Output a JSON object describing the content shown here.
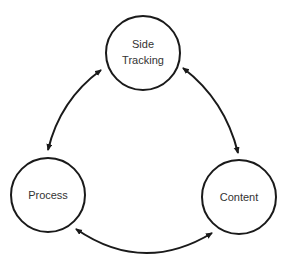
{
  "diagram": {
    "nodes": [
      {
        "id": "side-tracking",
        "line1": "Side",
        "line2": "Tracking"
      },
      {
        "id": "process",
        "label": "Process"
      },
      {
        "id": "content",
        "label": "Content"
      }
    ],
    "edges": [
      {
        "from": "side-tracking",
        "to": "process",
        "bidirectional": true
      },
      {
        "from": "side-tracking",
        "to": "content",
        "bidirectional": true
      },
      {
        "from": "process",
        "to": "content",
        "bidirectional": true
      }
    ],
    "colors": {
      "stroke": "#1a1a1a",
      "text": "#333333",
      "background": "#ffffff"
    }
  }
}
